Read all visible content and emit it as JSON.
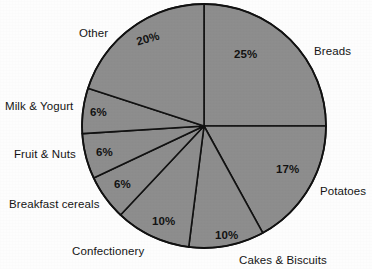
{
  "chart_data": {
    "type": "pie",
    "title": "",
    "subtitle": "",
    "xlabel": "",
    "ylabel": "",
    "legend_position": "none",
    "grid": false,
    "units": "percent",
    "start_angle_deg": 0,
    "direction": "clockwise",
    "total": 100,
    "categories": [
      "Breads",
      "Potatoes",
      "Cakes & Biscuits",
      "Confectionery",
      "Breakfast cereals",
      "Fruit & Nuts",
      "Milk & Yogurt",
      "Other"
    ],
    "values": [
      25,
      17,
      10,
      10,
      6,
      6,
      6,
      20
    ],
    "value_labels": [
      "25%",
      "17%",
      "10%",
      "10%",
      "6%",
      "6%",
      "6%",
      "20%"
    ],
    "slice_color": "#8d8d8d",
    "slice_border_color": "#111111",
    "background_color": "#fdfdfd",
    "label_color": "#141414"
  },
  "geometry": {
    "center_x": 204,
    "center_y": 126,
    "radius": 122
  },
  "slices": [
    {
      "name": "Breads",
      "value_label": "25%",
      "pct_x": 234,
      "pct_y": 48,
      "pct_rotation": 0,
      "cat_label": "Breads",
      "cat_x": 314,
      "cat_y": 45
    },
    {
      "name": "Potatoes",
      "value_label": "17%",
      "pct_x": 276,
      "pct_y": 163,
      "pct_rotation": 0,
      "cat_label": "Potatoes",
      "cat_x": 320,
      "cat_y": 185
    },
    {
      "name": "Cakes & Biscuits",
      "value_label": "10%",
      "pct_x": 215,
      "pct_y": 229,
      "pct_rotation": 0,
      "cat_label": "Cakes & Biscuits",
      "cat_x": 239,
      "cat_y": 254
    },
    {
      "name": "Confectionery",
      "value_label": "10%",
      "pct_x": 152,
      "pct_y": 215,
      "pct_rotation": 0,
      "cat_label": "Confectionery",
      "cat_x": 72,
      "cat_y": 245
    },
    {
      "name": "Breakfast cereals",
      "value_label": "6%",
      "pct_x": 114,
      "pct_y": 178,
      "pct_rotation": 0,
      "cat_label": "Breakfast cereals",
      "cat_x": 9,
      "cat_y": 198
    },
    {
      "name": "Fruit & Nuts",
      "value_label": "6%",
      "pct_x": 96,
      "pct_y": 146,
      "pct_rotation": 0,
      "cat_label": "Fruit & Nuts",
      "cat_x": 14,
      "cat_y": 148
    },
    {
      "name": "Milk & Yogurt",
      "value_label": "6%",
      "pct_x": 90,
      "pct_y": 106,
      "pct_rotation": 0,
      "cat_label": "Milk & Yogurt",
      "cat_x": 5,
      "cat_y": 100
    },
    {
      "name": "Other",
      "value_label": "20%",
      "pct_x": 135,
      "pct_y": 36,
      "pct_rotation": -16,
      "cat_label": "Other",
      "cat_x": 79,
      "cat_y": 27
    }
  ]
}
